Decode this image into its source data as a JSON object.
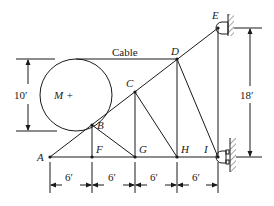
{
  "diagram": {
    "type": "truss",
    "colors": {
      "line": "#1a1a1a",
      "background": "#ffffff"
    },
    "joints": [
      {
        "id": "A",
        "label": "A"
      },
      {
        "id": "B",
        "label": "B"
      },
      {
        "id": "C",
        "label": "C"
      },
      {
        "id": "D",
        "label": "D"
      },
      {
        "id": "E",
        "label": "E"
      },
      {
        "id": "F",
        "label": "F"
      },
      {
        "id": "G",
        "label": "G"
      },
      {
        "id": "H",
        "label": "H"
      },
      {
        "id": "I",
        "label": "I"
      }
    ],
    "mass_label": "M +",
    "cable_label": "Cable",
    "dimensions": {
      "drum_diameter": "10′",
      "height": "18′",
      "spans": [
        "6′",
        "6′",
        "6′",
        "6′"
      ]
    },
    "supports": [
      {
        "joint": "E",
        "type": "pin-wall"
      },
      {
        "joint": "I",
        "type": "roller-wall"
      }
    ]
  }
}
